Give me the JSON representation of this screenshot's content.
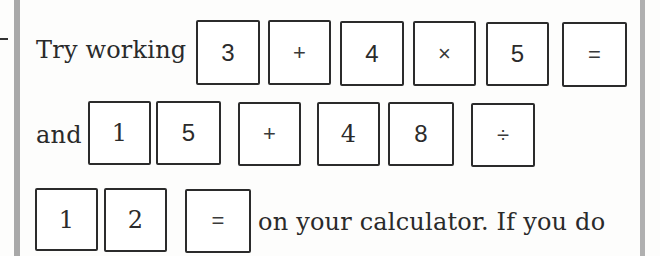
{
  "passage": {
    "line1": {
      "lead_text": "Try working",
      "keys": [
        "3",
        "+",
        "4",
        "×",
        "5",
        "="
      ]
    },
    "line2": {
      "lead_text": "and",
      "keys": [
        "1",
        "5",
        "+",
        "4",
        "8",
        "÷"
      ]
    },
    "line3": {
      "keys": [
        "1",
        "2",
        "="
      ],
      "trail_text": "on your calculator. If you do"
    }
  },
  "colors": {
    "margin_bar": "#a9a9a9",
    "key_border": "#2b2b2b",
    "text": "#2a2a2a"
  }
}
